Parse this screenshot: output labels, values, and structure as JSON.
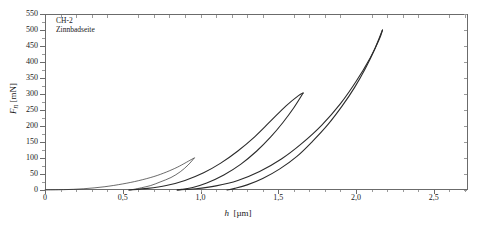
{
  "annotation": {
    "line1": "CH-2",
    "line2": "Zinnbadseite"
  },
  "axes": {
    "ylabel_symbol": "F",
    "ylabel_sub": "n",
    "ylabel_unit": "[mN]",
    "xlabel_symbol": "h",
    "xlabel_unit": "[µm]"
  },
  "chart_data": {
    "type": "line",
    "title": "",
    "subtitle": "",
    "xlabel": "h [µm]",
    "ylabel": "F_n [mN]",
    "xlim": [
      0,
      2.72
    ],
    "ylim": [
      0,
      550
    ],
    "xticks": [
      0,
      0.5,
      1.0,
      1.5,
      2.0,
      2.5
    ],
    "xtick_labels": [
      "0",
      "0,5",
      "1,0",
      "1,5",
      "2,0",
      "2,5"
    ],
    "yticks": [
      0,
      50,
      100,
      150,
      200,
      250,
      300,
      350,
      400,
      450,
      500,
      550
    ],
    "ytick_labels": [
      "0",
      "50",
      "100",
      "150",
      "200",
      "250",
      "300",
      "350",
      "400",
      "450",
      "500",
      "550"
    ],
    "grid": false,
    "legend": false,
    "annotations": [
      "CH-2",
      "Zinnbadseite"
    ],
    "line_color": "#2b2b2b",
    "series": [
      {
        "name": "cycle-1-loading",
        "points": [
          [
            0,
            0
          ],
          [
            0.12,
            1
          ],
          [
            0.25,
            4
          ],
          [
            0.38,
            10
          ],
          [
            0.5,
            19
          ],
          [
            0.6,
            29
          ],
          [
            0.7,
            42
          ],
          [
            0.78,
            56
          ],
          [
            0.85,
            71
          ],
          [
            0.9,
            84
          ],
          [
            0.94,
            95
          ],
          [
            0.96,
            100
          ]
        ]
      },
      {
        "name": "cycle-1-unloading",
        "points": [
          [
            0.96,
            100
          ],
          [
            0.92,
            78
          ],
          [
            0.87,
            57
          ],
          [
            0.81,
            39
          ],
          [
            0.74,
            25
          ],
          [
            0.68,
            14
          ],
          [
            0.62,
            7
          ],
          [
            0.57,
            2
          ],
          [
            0.54,
            0
          ]
        ]
      },
      {
        "name": "cycle-2-loading",
        "points": [
          [
            0.54,
            0
          ],
          [
            0.66,
            5
          ],
          [
            0.78,
            14
          ],
          [
            0.9,
            30
          ],
          [
            1.02,
            54
          ],
          [
            1.13,
            84
          ],
          [
            1.24,
            122
          ],
          [
            1.35,
            167
          ],
          [
            1.45,
            215
          ],
          [
            1.55,
            263
          ],
          [
            1.63,
            295
          ],
          [
            1.66,
            303
          ]
        ]
      },
      {
        "name": "cycle-2-unloading",
        "points": [
          [
            1.66,
            303
          ],
          [
            1.6,
            257
          ],
          [
            1.53,
            211
          ],
          [
            1.45,
            165
          ],
          [
            1.36,
            121
          ],
          [
            1.26,
            81
          ],
          [
            1.15,
            47
          ],
          [
            1.04,
            22
          ],
          [
            0.95,
            8
          ],
          [
            0.88,
            2
          ],
          [
            0.85,
            0
          ]
        ]
      },
      {
        "name": "cycle-3-loading",
        "points": [
          [
            0.85,
            0
          ],
          [
            0.97,
            4
          ],
          [
            1.1,
            13
          ],
          [
            1.24,
            30
          ],
          [
            1.38,
            58
          ],
          [
            1.52,
            97
          ],
          [
            1.65,
            145
          ],
          [
            1.78,
            203
          ],
          [
            1.9,
            270
          ],
          [
            2.0,
            339
          ],
          [
            2.09,
            412
          ],
          [
            2.15,
            472
          ],
          [
            2.17,
            500
          ]
        ]
      },
      {
        "name": "cycle-3-unloading",
        "points": [
          [
            2.17,
            500
          ],
          [
            2.12,
            440
          ],
          [
            2.06,
            380
          ],
          [
            1.99,
            320
          ],
          [
            1.91,
            262
          ],
          [
            1.82,
            205
          ],
          [
            1.72,
            152
          ],
          [
            1.62,
            105
          ],
          [
            1.51,
            66
          ],
          [
            1.4,
            36
          ],
          [
            1.3,
            16
          ],
          [
            1.22,
            5
          ],
          [
            1.17,
            0
          ]
        ]
      }
    ]
  }
}
